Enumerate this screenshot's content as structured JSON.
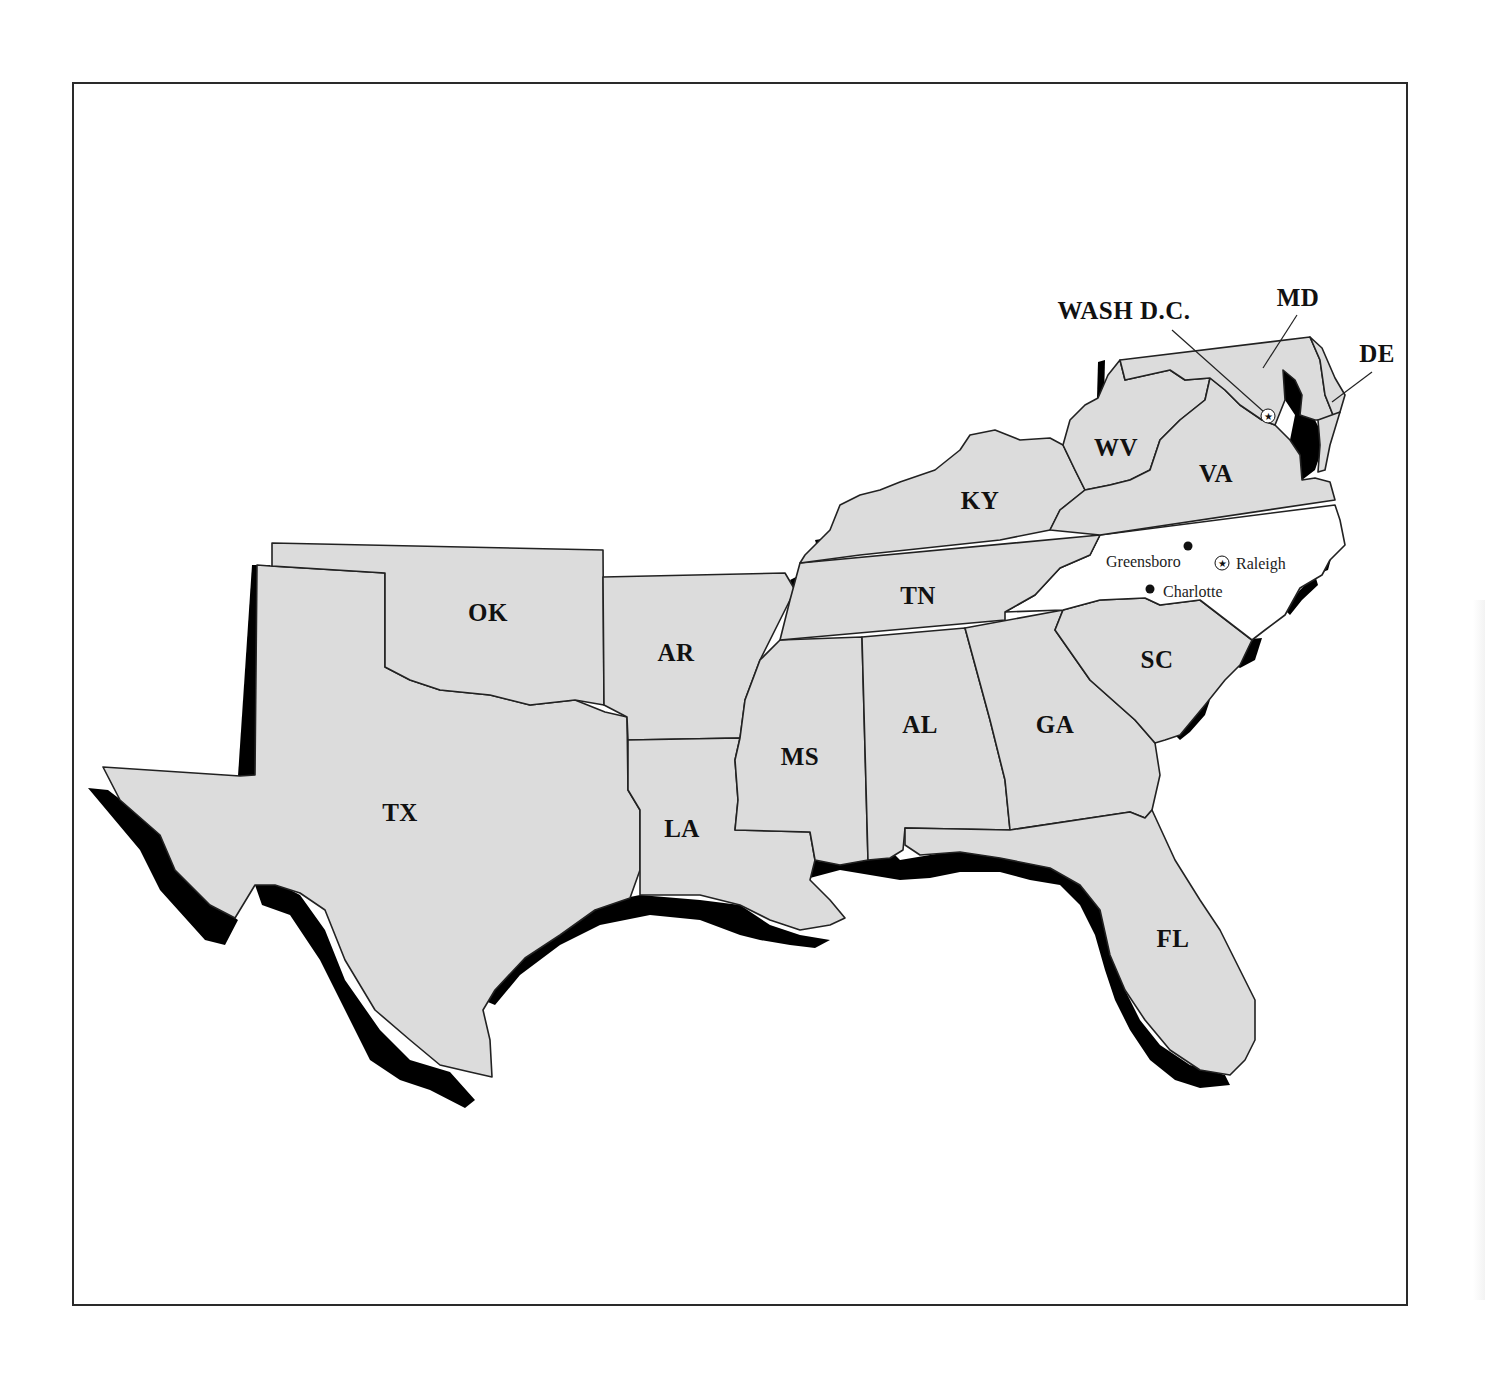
{
  "map": {
    "title": "",
    "highlight_state": "NC",
    "colors": {
      "state_fill": "#dcdcdc",
      "highlight_fill": "#ffffff",
      "coastline": "#000000",
      "border": "#222222",
      "frame": "#2a2a2a"
    },
    "state_labels": [
      {
        "code": "TX",
        "label": "TX",
        "x": 400,
        "y": 813
      },
      {
        "code": "OK",
        "label": "OK",
        "x": 488,
        "y": 613
      },
      {
        "code": "AR",
        "label": "AR",
        "x": 676,
        "y": 653
      },
      {
        "code": "LA",
        "label": "LA",
        "x": 682,
        "y": 829
      },
      {
        "code": "MS",
        "label": "MS",
        "x": 800,
        "y": 757
      },
      {
        "code": "AL",
        "label": "AL",
        "x": 920,
        "y": 725
      },
      {
        "code": "GA",
        "label": "GA",
        "x": 1055,
        "y": 725
      },
      {
        "code": "FL",
        "label": "FL",
        "x": 1173,
        "y": 939
      },
      {
        "code": "SC",
        "label": "SC",
        "x": 1157,
        "y": 660
      },
      {
        "code": "TN",
        "label": "TN",
        "x": 918,
        "y": 596
      },
      {
        "code": "KY",
        "label": "KY",
        "x": 980,
        "y": 501
      },
      {
        "code": "WV",
        "label": "WV",
        "x": 1116,
        "y": 448
      },
      {
        "code": "VA",
        "label": "VA",
        "x": 1216,
        "y": 474
      },
      {
        "code": "MD",
        "label": "MD",
        "x": 1298,
        "y": 298
      },
      {
        "code": "DE",
        "label": "DE",
        "x": 1377,
        "y": 354
      },
      {
        "code": "DC",
        "label": "WASH D.C.",
        "x": 1124,
        "y": 311
      }
    ],
    "cities": [
      {
        "name": "Greensboro",
        "type": "city",
        "dot_x": 1188,
        "dot_y": 546,
        "label_x": 1106,
        "label_y": 562
      },
      {
        "name": "Raleigh",
        "type": "capital",
        "dot_x": 1222,
        "dot_y": 563,
        "label_x": 1236,
        "label_y": 564
      },
      {
        "name": "Charlotte",
        "type": "city",
        "dot_x": 1150,
        "dot_y": 589,
        "label_x": 1163,
        "label_y": 592
      }
    ],
    "capital_markers": [
      {
        "name": "Washington D.C.",
        "x": 1268,
        "y": 416
      }
    ],
    "leader_lines": [
      {
        "from": "WASH D.C.",
        "x1": 1172,
        "y1": 330,
        "x2": 1264,
        "y2": 412
      },
      {
        "from": "MD",
        "x1": 1297,
        "y1": 315,
        "x2": 1263,
        "y2": 368
      },
      {
        "from": "DE",
        "x1": 1372,
        "y1": 372,
        "x2": 1332,
        "y2": 402
      }
    ]
  }
}
